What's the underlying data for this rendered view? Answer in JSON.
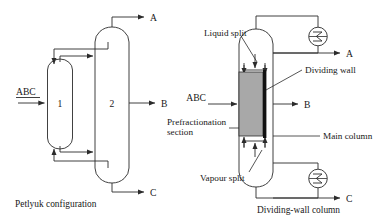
{
  "figure": {
    "title_left": "Petlyuk configuration",
    "title_right": "Dividing-wall column",
    "background_color": "#ffffff",
    "line_color": "#2b2b2b"
  },
  "petlyuk": {
    "caption": "Petlyuk configuration",
    "feed_label": "ABC",
    "column_prefractionator_label": "1",
    "column_main_label": "2",
    "product_top_label": "A",
    "product_side_label": "B",
    "product_bottom_label": "C"
  },
  "dwc": {
    "caption": "Dividing-wall column",
    "feed_label": "ABC",
    "product_top_label": "A",
    "product_side_label": "B",
    "product_bottom_label": "C",
    "annotations": {
      "liquid_split": "Liquid split",
      "vapour_split": "Vapour split",
      "dividing_wall": "Dividing wall",
      "main_column": "Main column",
      "prefractionation_line1": "Prefractionation",
      "prefractionation_line2": "section"
    },
    "colors": {
      "prefractionation_fill": "#a8a8a8",
      "dividing_wall_fill": "#111111"
    },
    "heat_exchangers": {
      "condenser_symbol": "sigma-heat-exchanger-icon",
      "reboiler_symbol": "sigma-heat-exchanger-icon"
    }
  }
}
